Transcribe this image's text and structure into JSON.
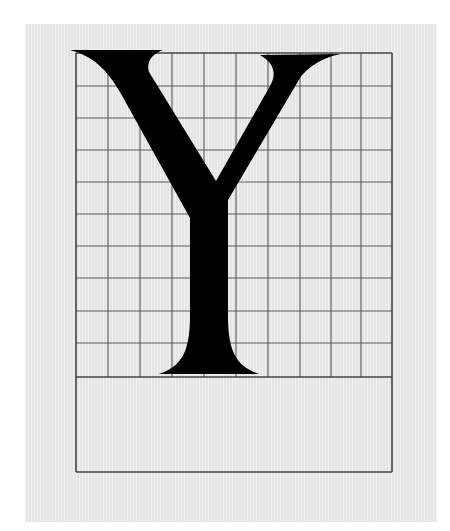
{
  "figure": {
    "letter": "Y",
    "grid": {
      "columns": 10,
      "rows": 10,
      "line_color": "#555555"
    },
    "colors": {
      "page": "#ffffff",
      "panel": "#e9e9e9",
      "glyph": "#000000",
      "frame": "#444444"
    }
  }
}
